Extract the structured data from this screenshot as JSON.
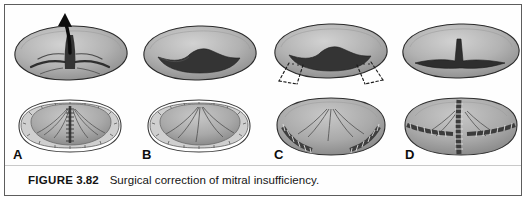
{
  "figure": {
    "caption_label": "FIGURE",
    "caption_number": "3.82",
    "caption_text": "Surgical correction of mitral insufficiency.",
    "border_color": "#5d5d5d",
    "background_color": "#fefefe"
  },
  "palette": {
    "valve_light": "#c2c2c2",
    "valve_mid": "#a8a8a8",
    "valve_shadow": "#8a8a8a",
    "leaflet_dark": "#3a3a3a",
    "outline": "#2b2b2b",
    "ring_fill": "#cfcfcf",
    "suture_dark": "#4a4a4a",
    "arrow_black": "#0c0c0c",
    "label_color": "#0d0d0d"
  },
  "panels": [
    {
      "letter": "A",
      "top_view_name": "mitral-valve-regurgitant-orifice",
      "bottom_view_name": "annuloplasty-ring-with-central-suture-line",
      "features": [
        "regurgitant jet",
        "upward arrow",
        "open central orifice",
        "C-shaped annuloplasty ring",
        "vertical suture line"
      ]
    },
    {
      "letter": "B",
      "top_view_name": "mitral-valve-closed-leaflets",
      "bottom_view_name": "annuloplasty-ring-no-suture",
      "features": [
        "coapted leaflets",
        "arched leaflet edge",
        "C-shaped annuloplasty ring",
        "radial chordae"
      ]
    },
    {
      "letter": "C",
      "top_view_name": "mitral-valve-with-resection-markings",
      "bottom_view_name": "annuloplasty-ring-with-lateral-sutures",
      "features": [
        "dashed resection wedges",
        "bilateral excision markers",
        "two lateral stitched bands"
      ]
    },
    {
      "letter": "D",
      "top_view_name": "mitral-valve-repaired-slit",
      "bottom_view_name": "annuloplasty-ring-with-t-suture-pattern",
      "features": [
        "narrow closed slit",
        "central vertical spike",
        "central vertical suture line",
        "horizontal lateral suture bands"
      ]
    }
  ]
}
